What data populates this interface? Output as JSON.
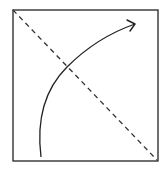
{
  "diagram": {
    "frame": {
      "x": 13,
      "y": 10,
      "width": 145,
      "height": 151,
      "stroke": "#222222"
    },
    "diagonal": {
      "x1": 13,
      "y1": 10,
      "x2": 157,
      "y2": 160,
      "style": "dashed",
      "stroke": "#333333"
    },
    "curve": {
      "path": "M 41 157 C 37 125, 42 92, 67 67 C 88 46, 112 32, 135 24",
      "stroke": "#222222",
      "arrowhead": "open",
      "tip": {
        "x": 135,
        "y": 24
      }
    },
    "intersection": {
      "x": 67,
      "y": 67
    }
  }
}
